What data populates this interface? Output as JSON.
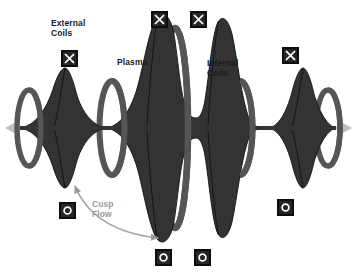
{
  "figure": {
    "title": "",
    "type": "physics-schematic-diagram",
    "background_color": "#ffffff",
    "width": 357,
    "height": 277
  },
  "colors": {
    "plasma_fill": "#333333",
    "plasma_stroke": "#111111",
    "coil_fill": "#555555",
    "marker_box_fill": "#262626",
    "marker_box_border": "#0d0d0d",
    "marker_glyph": "#ffffff",
    "label_text": "#1a1a1a",
    "cusp_accent": "#9a9a9a",
    "axis_arrow": "#b0b0b0"
  },
  "labels": [
    {
      "id": "external-coils",
      "text": "External\nCoils",
      "x": 51,
      "y": 18,
      "color": "#1a1a1a"
    },
    {
      "id": "plasma",
      "text": "Plasma",
      "x": 117,
      "y": 57,
      "color": "#1a1a1a"
    },
    {
      "id": "internal-coils",
      "text": "Internal\nCoils",
      "x": 207,
      "y": 58,
      "color": "#1a1a1a"
    },
    {
      "id": "cusp-flow",
      "text": "Cusp\nFlow",
      "x": 92,
      "y": 199,
      "color": "#9a9a9a"
    }
  ],
  "markers": [
    {
      "id": "x-marker-external-left",
      "glyph": "X",
      "x": 61,
      "y": 50
    },
    {
      "id": "x-marker-top-center-1",
      "glyph": "X",
      "x": 151,
      "y": 11
    },
    {
      "id": "x-marker-top-center-2",
      "glyph": "X",
      "x": 190,
      "y": 11
    },
    {
      "id": "x-marker-right",
      "glyph": "X",
      "x": 282,
      "y": 47
    },
    {
      "id": "o-marker-left",
      "glyph": "O",
      "x": 59,
      "y": 202
    },
    {
      "id": "o-marker-bottom-center-1",
      "glyph": "O",
      "x": 155,
      "y": 249
    },
    {
      "id": "o-marker-bottom-center-2",
      "glyph": "O",
      "x": 194,
      "y": 249
    },
    {
      "id": "o-marker-right",
      "glyph": "O",
      "x": 277,
      "y": 199
    }
  ],
  "coils": [
    {
      "id": "coil-1",
      "cx": 29,
      "cy": 128,
      "rx": 12,
      "ry": 38,
      "thickness": 5.5,
      "kind": "external"
    },
    {
      "id": "coil-2",
      "cx": 112,
      "cy": 128,
      "rx": 12.5,
      "ry": 47,
      "thickness": 6,
      "kind": "internal"
    },
    {
      "id": "coil-3",
      "cx": 175,
      "cy": 128,
      "rx": 13,
      "ry": 100,
      "thickness": 6.5,
      "kind": "internal"
    },
    {
      "id": "coil-4",
      "cx": 240,
      "cy": 128,
      "rx": 12.5,
      "ry": 47,
      "thickness": 6,
      "kind": "internal"
    },
    {
      "id": "coil-5",
      "cx": 328,
      "cy": 128,
      "rx": 12,
      "ry": 38,
      "thickness": 5.5,
      "kind": "external"
    }
  ],
  "plasma_lobes": [
    {
      "id": "lobe-1",
      "cx": 65,
      "half_height": 58,
      "half_width": 14,
      "note": "left side lobe"
    },
    {
      "id": "lobe-2",
      "cx": 157,
      "half_height": 115,
      "half_width": 17,
      "note": "central left lobe"
    },
    {
      "id": "lobe-3",
      "cx": 196,
      "half_height": 115,
      "half_width": 19,
      "note": "central right lobe"
    },
    {
      "id": "lobe-4",
      "cx": 288,
      "half_height": 58,
      "half_width": 14,
      "note": "right side lobe"
    }
  ],
  "axis": {
    "y": 128,
    "x_start": 8,
    "x_end": 350,
    "left_arrow": true,
    "right_arrow": true
  },
  "cusp_arrow": {
    "id": "cusp-flow-arrow",
    "start": {
      "x": 75,
      "y": 185
    },
    "end": {
      "x": 160,
      "y": 239
    },
    "double_headed": true,
    "color": "#9a9a9a"
  }
}
